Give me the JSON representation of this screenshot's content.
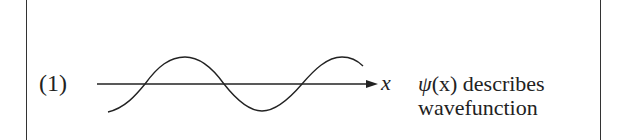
{
  "figure": {
    "item_number": "(1)",
    "axis_label": "x",
    "description": {
      "psi_symbol": "ψ",
      "argument": "(x)",
      "line1_rest": " describes",
      "line2": "wavefunction"
    },
    "colors": {
      "stroke": "#222222",
      "background": "#ffffff"
    }
  }
}
